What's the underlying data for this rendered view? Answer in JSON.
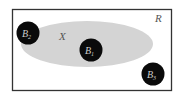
{
  "diagram": {
    "region": {
      "label": "R",
      "stroke": "#333333",
      "fill": "#ffffff"
    },
    "set": {
      "label": "X",
      "fill": "#d4d4d4"
    },
    "balls": [
      {
        "name": "B",
        "sub": "1",
        "cx": 91,
        "cy": 50
      },
      {
        "name": "B",
        "sub": "2",
        "cx": 28,
        "cy": 33
      },
      {
        "name": "B",
        "sub": "3",
        "cx": 153,
        "cy": 74
      }
    ],
    "ball_fill": "#0a0a0a",
    "ball_text": "#cccccc"
  }
}
